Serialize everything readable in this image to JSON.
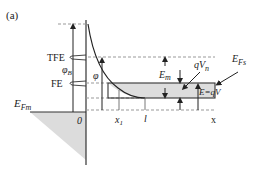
{
  "figure": {
    "panel_label": "(a)",
    "labels": {
      "tfe": "TFE",
      "fe": "FE",
      "phi_b": "φ",
      "phi_b_sub": "B",
      "phi": "φ",
      "e_fm": "E",
      "e_fm_sub": "Fm",
      "zero": "0",
      "x1": "x",
      "x1_sub": "1",
      "l": "l",
      "x_axis": "x",
      "e_m": "E",
      "e_m_sub": "m",
      "q_vn": "qV",
      "q_vn_sub": "n",
      "e_fs": "E",
      "e_fs_sub": "Fs",
      "e_qv": "E=qV"
    },
    "colors": {
      "line": "#333333",
      "dash": "#999999",
      "shade": "#dddddd"
    }
  }
}
